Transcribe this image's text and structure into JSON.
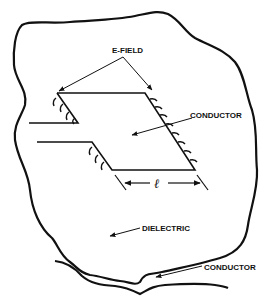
{
  "diagram": {
    "labels": {
      "efield": "E-FIELD",
      "conductor_patch": "CONDUCTOR",
      "length_symbol": "ℓ",
      "dielectric": "DIELECTRIC",
      "conductor_ground": "CONDUCTOR"
    },
    "colors": {
      "ink": "#111111",
      "background": "#ffffff"
    }
  }
}
